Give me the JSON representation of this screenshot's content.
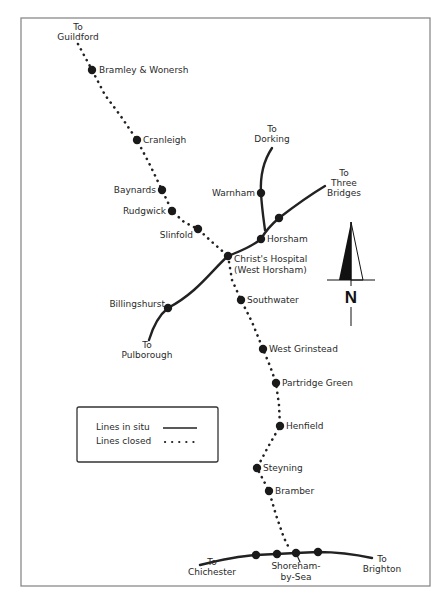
{
  "map": {
    "colors": {
      "line": "#222222",
      "frame": "#8a8a8a",
      "text": "#2a2a2a",
      "background": "#ffffff"
    },
    "frame": {
      "x": 21,
      "y": 18,
      "width": 409,
      "height": 568
    },
    "stations": [
      {
        "id": "bramley",
        "label": "Bramley & Wonersh",
        "x": 92,
        "y": 70,
        "lx": 99,
        "ly": 73,
        "anchor": "start"
      },
      {
        "id": "cranleigh",
        "label": "Cranleigh",
        "x": 137,
        "y": 140,
        "lx": 143,
        "ly": 143,
        "anchor": "start"
      },
      {
        "id": "baynards",
        "label": "Baynards",
        "x": 162,
        "y": 190,
        "lx": 156,
        "ly": 193,
        "anchor": "end"
      },
      {
        "id": "rudgwick",
        "label": "Rudgwick",
        "x": 172,
        "y": 211,
        "lx": 166,
        "ly": 214,
        "anchor": "end"
      },
      {
        "id": "slinfold",
        "label": "Slinfold",
        "x": 198,
        "y": 229,
        "lx": 193,
        "ly": 238,
        "anchor": "end"
      },
      {
        "id": "warnham",
        "label": "Warnham",
        "x": 261,
        "y": 193,
        "lx": 255,
        "ly": 196,
        "anchor": "end"
      },
      {
        "id": "three-bridges-intermediate",
        "label": "",
        "x": 279,
        "y": 218,
        "lx": 0,
        "ly": 0,
        "anchor": "start"
      },
      {
        "id": "horsham",
        "label": "Horsham",
        "x": 261,
        "y": 239,
        "lx": 267,
        "ly": 242,
        "anchor": "start"
      },
      {
        "id": "christs-hospital",
        "label": "Christ's Hospital",
        "label2": "(West Horsham)",
        "x": 228,
        "y": 256,
        "lx": 234,
        "ly": 262,
        "anchor": "start"
      },
      {
        "id": "billingshurst",
        "label": "Billingshurst",
        "x": 168,
        "y": 308,
        "lx": 165,
        "ly": 307,
        "anchor": "end"
      },
      {
        "id": "southwater",
        "label": "Southwater",
        "x": 241,
        "y": 300,
        "lx": 247,
        "ly": 303,
        "anchor": "start"
      },
      {
        "id": "west-grinstead",
        "label": "West Grinstead",
        "x": 263,
        "y": 349,
        "lx": 269,
        "ly": 352,
        "anchor": "start"
      },
      {
        "id": "partridge-green",
        "label": "Partridge Green",
        "x": 276,
        "y": 383,
        "lx": 282,
        "ly": 386,
        "anchor": "start"
      },
      {
        "id": "henfield",
        "label": "Henfield",
        "x": 280,
        "y": 426,
        "lx": 286,
        "ly": 429,
        "anchor": "start"
      },
      {
        "id": "steyning",
        "label": "Steyning",
        "x": 257,
        "y": 468,
        "lx": 263,
        "ly": 471,
        "anchor": "start"
      },
      {
        "id": "bramber",
        "label": "Bramber",
        "x": 269,
        "y": 491,
        "lx": 275,
        "ly": 494,
        "anchor": "start"
      },
      {
        "id": "coast-1",
        "label": "",
        "x": 256,
        "y": 555,
        "lx": 0,
        "ly": 0,
        "anchor": "start"
      },
      {
        "id": "coast-2",
        "label": "",
        "x": 277,
        "y": 554,
        "lx": 0,
        "ly": 0,
        "anchor": "start"
      },
      {
        "id": "shoreham",
        "label": "Shoreham-",
        "label2": "by-Sea",
        "x": 296,
        "y": 553,
        "lx": 296,
        "ly": 569,
        "anchor": "middle"
      },
      {
        "id": "coast-4",
        "label": "",
        "x": 318,
        "y": 552,
        "lx": 0,
        "ly": 0,
        "anchor": "start"
      }
    ],
    "destinations": [
      {
        "id": "to-guildford",
        "line1": "To",
        "line2": "Guildford",
        "x": 78,
        "y": 30
      },
      {
        "id": "to-dorking",
        "line1": "To",
        "line2": "Dorking",
        "x": 272,
        "y": 132
      },
      {
        "id": "to-three-bridges",
        "line1": "To",
        "line2": "Three",
        "line3": "Bridges",
        "x": 344,
        "y": 176
      },
      {
        "id": "to-pulborough",
        "line1": "To",
        "line2": "Pulborough",
        "x": 147,
        "y": 348
      },
      {
        "id": "to-chichester",
        "line1": "To",
        "line2": "Chichester",
        "x": 212,
        "y": 565
      },
      {
        "id": "to-brighton",
        "line1": "To",
        "line2": "Brighton",
        "x": 382,
        "y": 562
      }
    ],
    "legend": {
      "x": 77,
      "y": 407,
      "width": 141,
      "height": 55,
      "items": [
        {
          "label": "Lines in situ",
          "style": "solid"
        },
        {
          "label": "Lines closed",
          "style": "dotted"
        }
      ]
    },
    "north_arrow": {
      "label": "N",
      "x": 351,
      "apex_y": 222,
      "base_y": 280
    }
  }
}
